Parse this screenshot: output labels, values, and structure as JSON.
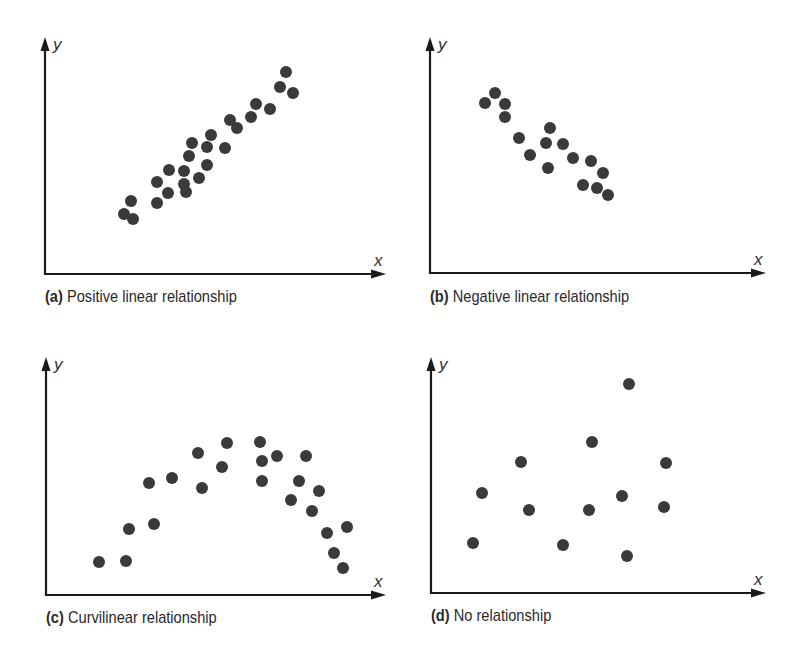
{
  "figure": {
    "background": "#ffffff",
    "axis_color": "#1a1a1a",
    "dot_color": "#3a3a3a",
    "dot_radius": 6
  },
  "panels": [
    {
      "id": "a",
      "label": "(a)",
      "caption": "Positive linear relationship",
      "x_axis": "x",
      "y_axis": "y",
      "axis": {
        "ox": 45,
        "oy": 274,
        "top": 37,
        "right": 386
      },
      "caption_pos": {
        "x": 45,
        "y": 287
      }
    },
    {
      "id": "b",
      "label": "(b)",
      "caption": "Negative linear relationship",
      "x_axis": "x",
      "y_axis": "y",
      "axis": {
        "ox": 430,
        "oy": 273,
        "top": 37,
        "right": 766
      },
      "caption_pos": {
        "x": 430,
        "y": 287
      }
    },
    {
      "id": "c",
      "label": "(c)",
      "caption": "Curvilinear relationship",
      "x_axis": "x",
      "y_axis": "y",
      "axis": {
        "ox": 46,
        "oy": 595,
        "top": 357,
        "right": 386
      },
      "caption_pos": {
        "x": 46,
        "y": 608
      }
    },
    {
      "id": "d",
      "label": "(d)",
      "caption": "No relationship",
      "x_axis": "x",
      "y_axis": "y",
      "axis": {
        "ox": 431,
        "oy": 593,
        "top": 357,
        "right": 766
      },
      "caption_pos": {
        "x": 431,
        "y": 606
      }
    }
  ],
  "chart_data": [
    {
      "type": "scatter",
      "title": "(a) Positive linear relationship",
      "xlabel": "x",
      "ylabel": "y",
      "grid": false,
      "points_px": [
        [
          286,
          72
        ],
        [
          280,
          87
        ],
        [
          293,
          93
        ],
        [
          256,
          104
        ],
        [
          270,
          109
        ],
        [
          251,
          117
        ],
        [
          230,
          120
        ],
        [
          237,
          128
        ],
        [
          211,
          135
        ],
        [
          192,
          143
        ],
        [
          207,
          147
        ],
        [
          225,
          148
        ],
        [
          189,
          156
        ],
        [
          207,
          165
        ],
        [
          169,
          170
        ],
        [
          184,
          171
        ],
        [
          199,
          178
        ],
        [
          157,
          182
        ],
        [
          184,
          184
        ],
        [
          168,
          193
        ],
        [
          186,
          192
        ],
        [
          131,
          201
        ],
        [
          157,
          203
        ],
        [
          124,
          214
        ],
        [
          133,
          219
        ]
      ]
    },
    {
      "type": "scatter",
      "title": "(b) Negative linear relationship",
      "xlabel": "x",
      "ylabel": "y",
      "grid": false,
      "points_px": [
        [
          495,
          93
        ],
        [
          485,
          103
        ],
        [
          505,
          104
        ],
        [
          505,
          117
        ],
        [
          550,
          128
        ],
        [
          519,
          138
        ],
        [
          546,
          143
        ],
        [
          563,
          144
        ],
        [
          530,
          155
        ],
        [
          573,
          158
        ],
        [
          591,
          161
        ],
        [
          548,
          168
        ],
        [
          603,
          173
        ],
        [
          583,
          185
        ],
        [
          597,
          188
        ],
        [
          608,
          195
        ]
      ]
    },
    {
      "type": "scatter",
      "title": "(c) Curvilinear relationship",
      "xlabel": "x",
      "ylabel": "y",
      "grid": false,
      "points_px": [
        [
          99,
          562
        ],
        [
          126,
          561
        ],
        [
          129,
          529
        ],
        [
          154,
          524
        ],
        [
          149,
          483
        ],
        [
          172,
          478
        ],
        [
          198,
          453
        ],
        [
          202,
          488
        ],
        [
          227,
          443
        ],
        [
          222,
          467
        ],
        [
          260,
          442
        ],
        [
          262,
          461
        ],
        [
          262,
          481
        ],
        [
          277,
          456
        ],
        [
          306,
          456
        ],
        [
          299,
          481
        ],
        [
          291,
          500
        ],
        [
          319,
          491
        ],
        [
          312,
          511
        ],
        [
          327,
          533
        ],
        [
          347,
          527
        ],
        [
          334,
          553
        ],
        [
          343,
          568
        ]
      ]
    },
    {
      "type": "scatter",
      "title": "(d) No relationship",
      "xlabel": "x",
      "ylabel": "y",
      "grid": false,
      "points_px": [
        [
          629,
          384
        ],
        [
          592,
          442
        ],
        [
          521,
          462
        ],
        [
          666,
          463
        ],
        [
          482,
          493
        ],
        [
          622,
          496
        ],
        [
          529,
          510
        ],
        [
          589,
          510
        ],
        [
          664,
          507
        ],
        [
          473,
          543
        ],
        [
          563,
          545
        ],
        [
          627,
          556
        ]
      ]
    }
  ]
}
